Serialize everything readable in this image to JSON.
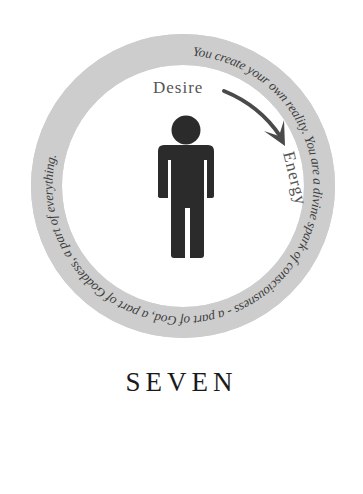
{
  "emblem": {
    "ring_text": "You create your own reality.  You are a divine spark of consciousness - a part of God, a part of Goddess, a part of everything.",
    "inner_labels": {
      "from": "Desire",
      "to": "Energy"
    },
    "icons": {
      "figure": "person-icon",
      "arrow": "curved-arrow-icon"
    },
    "colors": {
      "ring": "#cfcfcf",
      "figure": "#2b2b2b",
      "arrow": "#4a4a4a",
      "ring_text": "#3d3d3d",
      "label_text": "#555555"
    }
  },
  "chapter": {
    "title": "SEVEN"
  }
}
